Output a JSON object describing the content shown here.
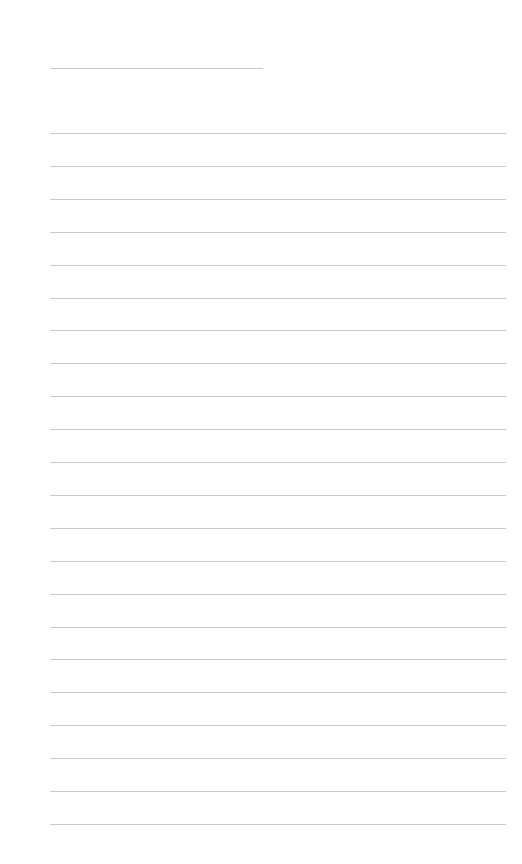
{
  "page": {
    "type": "blank lined paper",
    "header_line": {
      "present": true
    },
    "ruled_lines_count": 22,
    "line_color": "#c8c8c8",
    "background": "#ffffff"
  }
}
